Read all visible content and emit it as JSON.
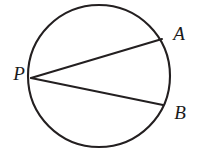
{
  "figure": {
    "kind": "geometry-diagram",
    "width": 201,
    "height": 161,
    "background_color": "#ffffff",
    "stroke_color": "#231f20",
    "label_color": "#1a1a1a",
    "circle": {
      "name": "circle",
      "center_x": 99,
      "center_y": 76,
      "radius": 71,
      "stroke_width": 2.1
    },
    "points": [
      {
        "id": "P",
        "label": "P",
        "x": 31,
        "y": 78,
        "label_x": 19,
        "label_y": 80,
        "font_size": 19
      },
      {
        "id": "A",
        "label": "A",
        "x": 162,
        "y": 39,
        "label_x": 179,
        "label_y": 40,
        "font_size": 19
      },
      {
        "id": "B",
        "label": "B",
        "x": 163,
        "y": 105,
        "label_x": 180,
        "label_y": 119,
        "font_size": 19
      }
    ],
    "chords": [
      {
        "id": "PA",
        "name": "chord-p-a",
        "x1": 31,
        "y1": 78,
        "x2": 162,
        "y2": 39,
        "stroke_width": 2.0
      },
      {
        "id": "PB",
        "name": "chord-p-b",
        "x1": 31,
        "y1": 78,
        "x2": 163,
        "y2": 105,
        "stroke_width": 2.0
      }
    ]
  }
}
